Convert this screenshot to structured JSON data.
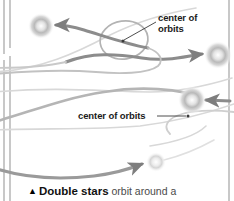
{
  "figure": {
    "background_color": "#ffffff",
    "rule_color": "#9b9b9b",
    "orbit_color": "#b0b0b0",
    "arrow_color": "#8c8c8c",
    "star_color": "#c9c9c9",
    "text_color": "#1b1b1b",
    "caption_color": "#4a4a4a"
  },
  "labels": {
    "top": {
      "line1": "center of",
      "line2": "orbits"
    },
    "middle": {
      "text": "center of orbits"
    }
  },
  "caption": {
    "marker": "▲",
    "lead": "Double stars",
    "rest": " orbit around a"
  },
  "stars": [
    {
      "name": "star-top-left",
      "cx": 41,
      "cy": 26,
      "r": 7.5
    },
    {
      "name": "star-right-upper",
      "cx": 218,
      "cy": 55,
      "r": 8.0
    },
    {
      "name": "star-right-mid",
      "cx": 192,
      "cy": 100,
      "r": 8.0
    },
    {
      "name": "star-bottom",
      "cx": 156,
      "cy": 162,
      "r": 5.5
    }
  ],
  "centers": [
    {
      "name": "orbit-center-top",
      "cx": 123,
      "cy": 41
    },
    {
      "name": "orbit-center-middle",
      "cx": 188,
      "cy": 116
    }
  ]
}
